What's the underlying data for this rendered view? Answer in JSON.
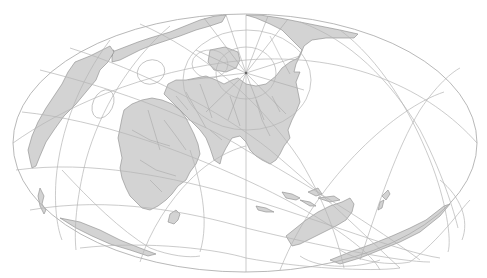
{
  "map": {
    "title": "World map, oblique elliptical projection with graticule",
    "projection_outline": {
      "cx": 245,
      "cy": 143,
      "rx": 232,
      "ry": 129
    },
    "pole": {
      "x": 246,
      "y": 73
    },
    "colors": {
      "land": "#d3d3d3",
      "coast": "#8a8a8a",
      "graticule": "#b4b4b4",
      "background": "#ffffff"
    },
    "regions": [
      {
        "id": "eurasia",
        "label": "Eurasia"
      },
      {
        "id": "africa",
        "label": "Africa"
      },
      {
        "id": "north-america",
        "label": "North America"
      },
      {
        "id": "south-america",
        "label": "South America"
      },
      {
        "id": "australia",
        "label": "Australia"
      },
      {
        "id": "antarctica",
        "label": "Antarctica"
      },
      {
        "id": "greenland",
        "label": "Greenland"
      },
      {
        "id": "madagascar",
        "label": "Madagascar"
      },
      {
        "id": "indonesia",
        "label": "Indonesia"
      },
      {
        "id": "new-zealand",
        "label": "New Zealand"
      }
    ]
  }
}
